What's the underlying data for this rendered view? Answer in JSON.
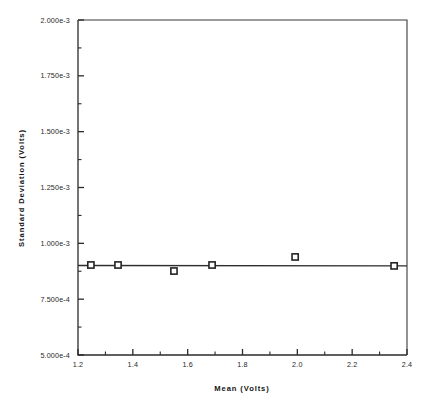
{
  "chart_data": {
    "type": "scatter",
    "title": "",
    "subtitle": "",
    "xlabel": "Mean   (Volts)",
    "ylabel": "Standard   Deviation   (Volts)",
    "xlim": [
      1.2,
      2.4
    ],
    "ylim": [
      0.0005,
      0.002
    ],
    "grid": false,
    "legend": "none",
    "x_major_ticks": [
      1.2,
      1.4,
      1.6,
      1.8,
      2.0,
      2.2,
      2.4
    ],
    "x_major_tick_labels": [
      "1.2",
      "1.4",
      "1.6",
      "1.8",
      "2.0",
      "2.2",
      "2.4"
    ],
    "x_minor_ticks": [
      1.3,
      1.5,
      1.7,
      1.9,
      2.1,
      2.3
    ],
    "y_major_ticks": [
      0.0005,
      0.00075,
      0.001,
      0.00125,
      0.0015,
      0.00175,
      0.002
    ],
    "y_major_tick_labels": [
      "5.000e-4",
      "7.500e-4",
      "1.000e-3",
      "1.250e-3",
      "1.500e-3",
      "1.750e-3",
      "2.000e-3"
    ],
    "y_minor_ticks": [
      0.000625,
      0.000875,
      0.001125,
      0.001375,
      0.001625,
      0.001875
    ],
    "marker_style": "open-square",
    "x": [
      1.247,
      1.346,
      1.55,
      1.689,
      1.992,
      2.353
    ],
    "y": [
      0.000903,
      0.000903,
      0.000876,
      0.000903,
      0.000939,
      0.000899
    ],
    "series": [
      {
        "name": "data",
        "points": [
          {
            "x": 1.247,
            "y": 0.000903
          },
          {
            "x": 1.346,
            "y": 0.000903
          },
          {
            "x": 1.55,
            "y": 0.000876
          },
          {
            "x": 1.689,
            "y": 0.000903
          },
          {
            "x": 1.992,
            "y": 0.000939
          },
          {
            "x": 2.353,
            "y": 0.000899
          }
        ]
      },
      {
        "name": "fit-line",
        "type": "line",
        "points": [
          {
            "x": 1.2,
            "y": 0.000901
          },
          {
            "x": 2.4,
            "y": 0.000899
          }
        ]
      }
    ],
    "colors": {
      "axis": "#2b2b2b",
      "marker_fill": "#ffffff",
      "marker_stroke": "#242424",
      "line": "#2e2e2e",
      "background": "#ffffff"
    }
  }
}
